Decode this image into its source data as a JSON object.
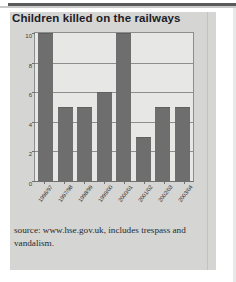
{
  "page": {
    "title": "Children killed on the railways",
    "source_note": "source: www.hse.gov.uk, includes trespass and vandalism."
  },
  "colors": {
    "panel_background": "#d5d5d3",
    "plot_background": "#e7e7e5",
    "bar_fill": "#6e6e6e",
    "gridline": "#8d8d8d",
    "axis": "#6f6f6f",
    "title_text": "#1d1d28",
    "source_text": "#2a2a2a",
    "top_rule": "#5a5a5a"
  },
  "chart_data": {
    "type": "bar",
    "title": "Children killed on the railways",
    "xlabel": "",
    "ylabel": "",
    "ylim": [
      0,
      10
    ],
    "yticks": [
      0,
      2,
      4,
      6,
      8,
      10
    ],
    "grid": true,
    "legend": false,
    "categories": [
      "1996/97",
      "1997/98",
      "1998/99",
      "1999/00",
      "2000/01",
      "2001/02",
      "2002/03",
      "2003/04"
    ],
    "values": [
      10,
      5,
      5,
      6,
      10,
      3,
      5,
      5
    ],
    "annotations": [
      "source: www.hse.gov.uk, includes trespass and vandalism."
    ]
  }
}
